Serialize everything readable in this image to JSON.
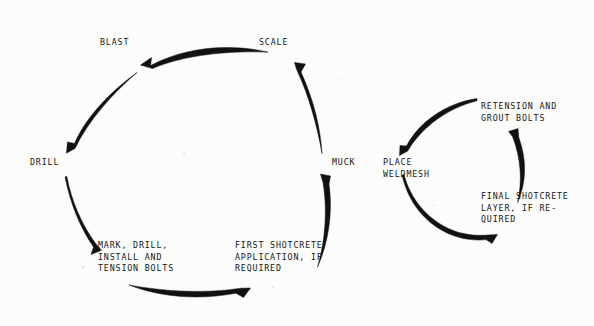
{
  "diagram": {
    "background_color": "#fcfcfa",
    "ink_color": "#111110",
    "main_cycle": {
      "name": "excavation-cycle",
      "direction": "counterclockwise",
      "steps": [
        {
          "id": "blast",
          "label": "BLAST"
        },
        {
          "id": "scale",
          "label": "SCALE"
        },
        {
          "id": "muck",
          "label": "MUCK"
        },
        {
          "id": "first-shotcrete",
          "label": "FIRST SHOTCRETE\nAPPLICATION, IF\nREQUIRED"
        },
        {
          "id": "mark-drill",
          "label": "MARK, DRILL,\nINSTALL AND\nTENSION BOLTS"
        },
        {
          "id": "drill",
          "label": "DRILL"
        }
      ]
    },
    "support_cycle": {
      "name": "support-cycle",
      "direction": "counterclockwise",
      "steps": [
        {
          "id": "place-weldmesh",
          "label": "PLACE\nWELDMESH"
        },
        {
          "id": "retension-grout",
          "label": "RETENSION AND\nGROUT BOLTS"
        },
        {
          "id": "final-shotcrete",
          "label": "FINAL SHOTCRETE\nLAYER, IF RE-\nQUIRED"
        }
      ]
    },
    "arrows": [
      {
        "id": "arrow-to-blast",
        "from": "scale",
        "to": "blast"
      },
      {
        "id": "arrow-to-drill",
        "from": "blast",
        "to": "drill"
      },
      {
        "id": "arrow-to-mark-drill",
        "from": "drill",
        "to": "mark-drill"
      },
      {
        "id": "arrow-to-first-shotcrete",
        "from": "mark-drill",
        "to": "first-shotcrete"
      },
      {
        "id": "arrow-to-muck",
        "from": "first-shotcrete",
        "to": "muck"
      },
      {
        "id": "arrow-to-scale",
        "from": "muck",
        "to": "scale"
      },
      {
        "id": "arrow-to-place-weldmesh",
        "from": "retension-grout",
        "to": "place-weldmesh"
      },
      {
        "id": "arrow-to-final-shotcrete",
        "from": "place-weldmesh",
        "to": "final-shotcrete"
      },
      {
        "id": "arrow-to-retension-grout",
        "from": "final-shotcrete",
        "to": "retension-grout"
      }
    ]
  }
}
